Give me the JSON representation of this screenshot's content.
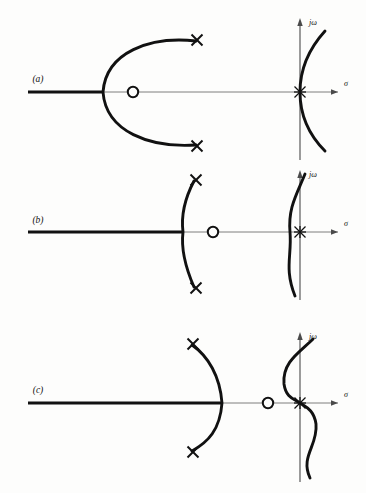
{
  "figure": {
    "background_color": "#fdfdfc",
    "ink_color": "#111111",
    "axis_color": "#6f6f6f",
    "width": 366,
    "height": 493
  },
  "axis_labels": {
    "imaginary": "jω",
    "real": "σ"
  },
  "panels": [
    {
      "id": "a",
      "label": "(a)",
      "label_x": 38,
      "label_y": 79,
      "axis_y": 92,
      "left_locus": {
        "x_start": 28,
        "x_end": 103
      },
      "real_axis": {
        "x_start": 103,
        "x_end": 340
      },
      "zero": {
        "x": 133,
        "y": 92,
        "r": 5.2,
        "symbol": "o"
      },
      "poles": [
        {
          "x": 197,
          "y": 40,
          "symbol": "x",
          "size": 7
        },
        {
          "x": 197,
          "y": 146,
          "symbol": "x",
          "size": 7
        },
        {
          "x": 300,
          "y": 92,
          "symbol": "x",
          "size": 7,
          "note": "origin double pole"
        }
      ],
      "breakaway_x": 103,
      "arc_shape": "c-shaped-open-right",
      "right_curve_shape": "parabola-opening-right",
      "jomega_axis": {
        "x": 300,
        "y_top": 20,
        "y_bottom": 160
      },
      "sigma_axis": {
        "y": 92,
        "x_end": 340
      },
      "jomega_label_pos": {
        "x": 309,
        "y": 24
      },
      "sigma_label_pos": {
        "x": 345,
        "y": 86
      }
    },
    {
      "id": "b",
      "label": "(b)",
      "label_x": 38,
      "label_y": 220,
      "axis_y": 232,
      "left_locus": {
        "x_start": 28,
        "x_end": 183
      },
      "real_axis": {
        "x_start": 183,
        "x_end": 340
      },
      "zero": {
        "x": 213,
        "y": 232,
        "r": 5.2,
        "symbol": "o"
      },
      "poles": [
        {
          "x": 196,
          "y": 180,
          "symbol": "x",
          "size": 7
        },
        {
          "x": 196,
          "y": 288,
          "symbol": "x",
          "size": 7
        },
        {
          "x": 300,
          "y": 232,
          "symbol": "x",
          "size": 7,
          "note": "origin double pole"
        }
      ],
      "breakaway_x": 183,
      "arc_shape": "arc-bulging-left",
      "right_curve_shape": "s-curve-through-origin",
      "jomega_axis": {
        "x": 300,
        "y_top": 170,
        "y_bottom": 300
      },
      "sigma_axis": {
        "y": 232,
        "x_end": 340
      },
      "jomega_label_pos": {
        "x": 309,
        "y": 174
      },
      "sigma_label_pos": {
        "x": 345,
        "y": 226
      }
    },
    {
      "id": "c",
      "label": "(c)",
      "label_x": 38,
      "label_y": 390,
      "axis_y": 403,
      "left_locus": {
        "x_start": 28,
        "x_end": 222
      },
      "real_axis": {
        "x_start": 222,
        "x_end": 340
      },
      "zero": {
        "x": 268,
        "y": 403,
        "r": 5.2,
        "symbol": "o"
      },
      "poles": [
        {
          "x": 193,
          "y": 344,
          "symbol": "x",
          "size": 7
        },
        {
          "x": 193,
          "y": 452,
          "symbol": "x",
          "size": 7
        },
        {
          "x": 300,
          "y": 403,
          "symbol": "x",
          "size": 7,
          "note": "origin double pole"
        }
      ],
      "breakaway_x": 222,
      "arc_shape": "arc-bulging-right",
      "right_curve_shape": "s-curve-through-origin-large",
      "jomega_axis": {
        "x": 300,
        "y_top": 332,
        "y_bottom": 482
      },
      "sigma_axis": {
        "y": 403,
        "x_end": 340
      },
      "jomega_label_pos": {
        "x": 309,
        "y": 336
      },
      "sigma_label_pos": {
        "x": 345,
        "y": 397
      }
    }
  ]
}
